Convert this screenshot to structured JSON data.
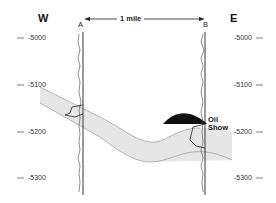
{
  "diagram": {
    "directions": {
      "west": "W",
      "east": "E"
    },
    "wells": [
      {
        "label": "A"
      },
      {
        "label": "B"
      }
    ],
    "distance_label": "1 mile",
    "depth_labels_left": [
      "-5000",
      "-5100",
      "-5200",
      "-5300"
    ],
    "depth_labels_right": [
      "-5000",
      "-5100",
      "-5200",
      "-5300"
    ],
    "annotation": {
      "line1": "Oil",
      "line2": "Show"
    },
    "colors": {
      "stratum_fill": "#e6e6e6",
      "oil_fill": "#111111",
      "line": "#222222",
      "background": "#ffffff"
    }
  }
}
